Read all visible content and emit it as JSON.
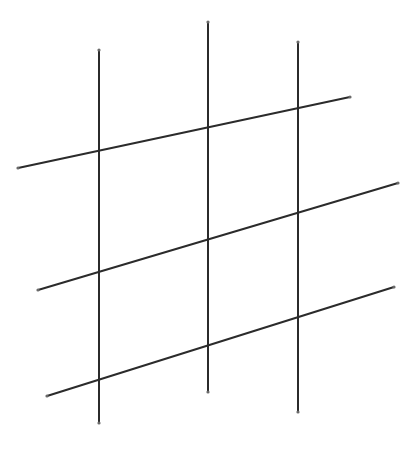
{
  "diagram": {
    "type": "line-grid",
    "stroke_color": "#2b2b2b",
    "endpoint_color": "#6a6a6a",
    "vertical_lines": [
      {
        "x1": 99,
        "y1": 50,
        "x2": 99,
        "y2": 423
      },
      {
        "x1": 208,
        "y1": 22,
        "x2": 208,
        "y2": 392
      },
      {
        "x1": 298,
        "y1": 42,
        "x2": 298,
        "y2": 412
      }
    ],
    "slanted_lines": [
      {
        "x1": 18,
        "y1": 168,
        "x2": 350,
        "y2": 97
      },
      {
        "x1": 38,
        "y1": 290,
        "x2": 398,
        "y2": 183
      },
      {
        "x1": 47,
        "y1": 396,
        "x2": 394,
        "y2": 287
      }
    ]
  }
}
